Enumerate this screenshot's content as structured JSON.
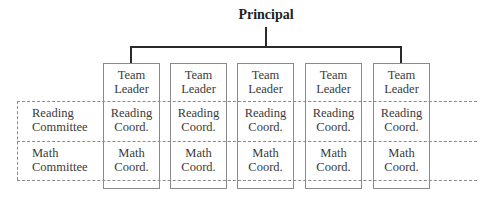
{
  "title": "Principal",
  "columns": [
    {
      "leader": "Team Leader",
      "leader_l1": "Team",
      "leader_l2": "Leader",
      "reading_l1": "Reading",
      "reading_l2": "Coord.",
      "math_l1": "Math",
      "math_l2": "Coord."
    },
    {
      "leader": "Team Leader",
      "leader_l1": "Team",
      "leader_l2": "Leader",
      "reading_l1": "Reading",
      "reading_l2": "Coord.",
      "math_l1": "Math",
      "math_l2": "Coord."
    },
    {
      "leader": "Team Leader",
      "leader_l1": "Team",
      "leader_l2": "Leader",
      "reading_l1": "Reading",
      "reading_l2": "Coord.",
      "math_l1": "Math",
      "math_l2": "Coord."
    },
    {
      "leader": "Team Leader",
      "leader_l1": "Team",
      "leader_l2": "Leader",
      "reading_l1": "Reading",
      "reading_l2": "Coord.",
      "math_l1": "Math",
      "math_l2": "Coord."
    },
    {
      "leader": "Team Leader",
      "leader_l1": "Team",
      "leader_l2": "Leader",
      "reading_l1": "Reading",
      "reading_l2": "Coord.",
      "math_l1": "Math",
      "math_l2": "Coord."
    }
  ],
  "rows": [
    {
      "label_l1": "Reading",
      "label_l2": "Committee"
    },
    {
      "label_l1": "Math",
      "label_l2": "Committee"
    }
  ],
  "colors": {
    "connector": "#2a2a2a",
    "box_border": "#8a8a8a",
    "text": "#3a3a3a"
  }
}
